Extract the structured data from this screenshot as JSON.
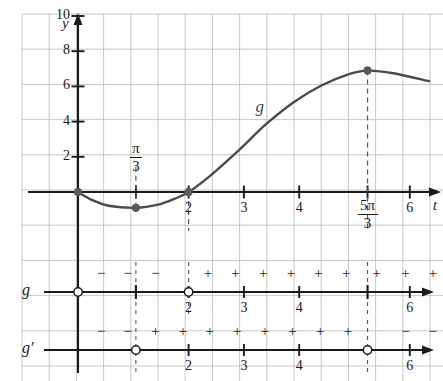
{
  "figure": {
    "type": "calculus-sign-analysis",
    "curve_label": "g",
    "axis_labels": {
      "y": "y",
      "t": "t"
    }
  },
  "chart_data": {
    "type": "line",
    "title": "",
    "xlabel": "t",
    "ylabel": "y",
    "xlim": [
      -0.45,
      6.6
    ],
    "ylim": [
      -2.2,
      11.4
    ],
    "grid": true,
    "legend": null,
    "series": [
      {
        "name": "g",
        "label_position": {
          "t": 3.3,
          "y": 4.8
        },
        "points": [
          {
            "t": 0.0,
            "y": 0.0
          },
          {
            "t": 0.25,
            "y": -0.45
          },
          {
            "t": 0.55,
            "y": -0.78
          },
          {
            "t": 1.047,
            "y": -0.9
          },
          {
            "t": 1.45,
            "y": -0.72
          },
          {
            "t": 1.75,
            "y": -0.38
          },
          {
            "t": 2.0,
            "y": 0.0
          },
          {
            "t": 2.4,
            "y": 0.95
          },
          {
            "t": 2.9,
            "y": 2.35
          },
          {
            "t": 3.4,
            "y": 3.85
          },
          {
            "t": 3.9,
            "y": 5.1
          },
          {
            "t": 4.4,
            "y": 6.05
          },
          {
            "t": 4.9,
            "y": 6.7
          },
          {
            "t": 5.236,
            "y": 6.9
          },
          {
            "t": 5.7,
            "y": 6.75
          },
          {
            "t": 6.35,
            "y": 6.3
          }
        ]
      }
    ],
    "marked_points": [
      {
        "t": 0.0,
        "y": 0.0,
        "label": "",
        "style": "filled"
      },
      {
        "t": 1.047,
        "y": -0.9,
        "label": "π/3",
        "style": "filled"
      },
      {
        "t": 2.0,
        "y": 0.0,
        "label": "2",
        "style": "filled"
      },
      {
        "t": 5.236,
        "y": 6.9,
        "label": "5π/3",
        "style": "filled"
      }
    ],
    "dashed_verticals": [
      {
        "t": 1.047,
        "from_y": -0.9,
        "to_y": 1.6
      },
      {
        "t": 2.0,
        "from_y": 0.0,
        "to_y": -2.2
      },
      {
        "t": 5.236,
        "from_y": 6.9,
        "to_y": -2.2
      }
    ],
    "y_ticks": [
      2,
      4,
      6,
      8,
      10
    ],
    "y_tick_labels": [
      "2",
      "4",
      "6",
      "8",
      "10"
    ],
    "x_ticks": [
      2,
      3,
      4,
      6
    ],
    "x_tick_labels": [
      "2",
      "3",
      "4",
      "6"
    ],
    "special_x_ticks": [
      {
        "value": 1.047,
        "label_num": "π",
        "label_den": "3"
      },
      {
        "value": 5.236,
        "label_num": "5π",
        "label_den": "3"
      }
    ]
  },
  "sign_lines": [
    {
      "name": "g",
      "row_label": "g",
      "endpoints": [
        {
          "t": 0.0,
          "marker": "open"
        },
        {
          "t": 1.047,
          "marker": "tick"
        },
        {
          "t": 2.0,
          "marker": "open"
        },
        {
          "t": 5.236,
          "marker": "tick"
        }
      ],
      "ticks": [
        {
          "t": 2.0,
          "label": "2"
        },
        {
          "t": 3.0,
          "label": "3"
        },
        {
          "t": 4.0,
          "label": "4"
        },
        {
          "t": 6.0,
          "label": "6"
        }
      ],
      "dashed_at": [
        1.047,
        2.0,
        5.236
      ],
      "signs": [
        {
          "t": 0.42,
          "sign": "−"
        },
        {
          "t": 0.9,
          "sign": "−"
        },
        {
          "t": 1.4,
          "sign": "−"
        },
        {
          "t": 2.35,
          "sign": "+"
        },
        {
          "t": 2.85,
          "sign": "+"
        },
        {
          "t": 3.35,
          "sign": "+"
        },
        {
          "t": 3.85,
          "sign": "+"
        },
        {
          "t": 4.35,
          "sign": "+"
        },
        {
          "t": 4.85,
          "sign": "+"
        },
        {
          "t": 5.4,
          "sign": "+"
        },
        {
          "t": 5.92,
          "sign": "+"
        },
        {
          "t": 6.42,
          "sign": "+"
        }
      ]
    },
    {
      "name": "g-prime",
      "row_label": "g′",
      "endpoints": [
        {
          "t": 1.047,
          "marker": "open"
        },
        {
          "t": 5.236,
          "marker": "open"
        }
      ],
      "ticks": [
        {
          "t": 2.0,
          "label": "2"
        },
        {
          "t": 3.0,
          "label": "3"
        },
        {
          "t": 4.0,
          "label": "4"
        },
        {
          "t": 6.0,
          "label": "6"
        }
      ],
      "dashed_at": [
        1.047,
        5.236
      ],
      "signs": [
        {
          "t": 0.42,
          "sign": "−"
        },
        {
          "t": 0.9,
          "sign": "−"
        },
        {
          "t": 1.4,
          "sign": "+"
        },
        {
          "t": 1.9,
          "sign": "+"
        },
        {
          "t": 2.38,
          "sign": "+"
        },
        {
          "t": 2.88,
          "sign": "+"
        },
        {
          "t": 3.38,
          "sign": "+"
        },
        {
          "t": 3.88,
          "sign": "+"
        },
        {
          "t": 4.38,
          "sign": "+"
        },
        {
          "t": 4.88,
          "sign": "+"
        },
        {
          "t": 5.92,
          "sign": "−"
        },
        {
          "t": 6.42,
          "sign": "−"
        }
      ]
    }
  ],
  "colors": {
    "grid": "#b9b9b9",
    "axis": "#1a1a1a",
    "curve": "#4a4a4a",
    "point": "#5a5a5a",
    "dashed": "#555555"
  }
}
